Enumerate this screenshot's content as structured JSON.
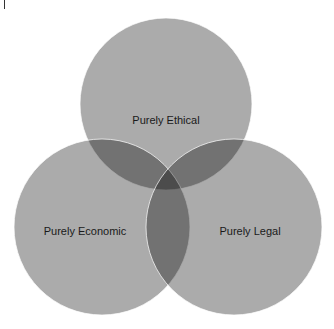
{
  "diagram": {
    "type": "venn",
    "sets": [
      {
        "id": "ethical",
        "label": "Purely Ethical",
        "cx": 166,
        "cy": 104,
        "r": 86
      },
      {
        "id": "economic",
        "label": "Purely Economic",
        "cx": 102,
        "cy": 227,
        "r": 88
      },
      {
        "id": "legal",
        "label": "Purely Legal",
        "cx": 234,
        "cy": 227,
        "r": 88
      }
    ],
    "colors": {
      "circle_fill": "#000000",
      "circle_opacity": "0.33",
      "stroke": "#ffffff"
    }
  }
}
